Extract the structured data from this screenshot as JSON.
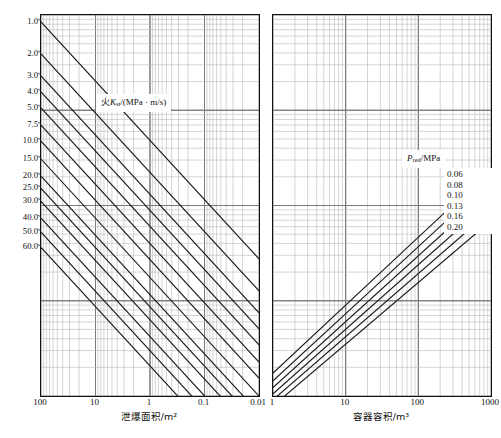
{
  "figure": {
    "title": "",
    "panels": [
      "left",
      "right"
    ]
  },
  "left": {
    "xaxis": {
      "title": "泄爆面积/m²",
      "ticks": [
        "100",
        "10",
        "1",
        "0.1",
        "0.01"
      ],
      "reversed": true
    },
    "legend": {
      "prefix": "火",
      "symbol": "K",
      "subscript": "st",
      "units": "/(MPa · m/s)",
      "full": "火Kst/(MPa · m/s)"
    },
    "series_labels": [
      "1.0",
      "2.0",
      "3.0",
      "4.0",
      "5.0",
      "7.5",
      "10.0",
      "15.0",
      "20.0",
      "25.0",
      "30.0",
      "40.0",
      "50.0",
      "60.0"
    ]
  },
  "right": {
    "xaxis": {
      "title": "容器容积/m³",
      "ticks": [
        "1",
        "10",
        "100",
        "1000"
      ],
      "reversed": false
    },
    "legend": {
      "symbol": "P",
      "subscript": "red",
      "units": "/MPa",
      "full": "Pred /MPa"
    },
    "series_labels": [
      "0.06",
      "0.08",
      "0.10",
      "0.13",
      "0.16",
      "0.20"
    ]
  },
  "colors": {
    "curve": "#1a1a1a",
    "major_grid": "#7a7a7a",
    "minor_grid": "#b8b8b8",
    "frame": "#111111",
    "background": "#ffffff"
  },
  "chart_data": {
    "type": "line",
    "title": "",
    "subtitle": "",
    "panels": [
      {
        "name": "left",
        "title": "",
        "xlabel": "泄爆面积/m²",
        "ylabel": "",
        "xscale": "log",
        "yscale": "log",
        "xlim": [
          100,
          0.01
        ],
        "x_reversed": true,
        "xticks": [
          100,
          10,
          1,
          0.1,
          0.01
        ],
        "grid": true,
        "legend": "火Kst/(MPa · m/s)",
        "legend_position": "center-upper",
        "series": [
          {
            "name": "1.0",
            "label_y_frac": 0.018,
            "x": [
              100,
              0.01
            ],
            "y_frac": [
              0.018,
              0.64
            ]
          },
          {
            "name": "2.0",
            "label_y_frac": 0.102,
            "x": [
              100,
              0.01
            ],
            "y_frac": [
              0.102,
              0.724
            ]
          },
          {
            "name": "3.0",
            "label_y_frac": 0.16,
            "x": [
              100,
              0.01
            ],
            "y_frac": [
              0.16,
              0.782
            ]
          },
          {
            "name": "4.0",
            "label_y_frac": 0.202,
            "x": [
              100,
              0.01
            ],
            "y_frac": [
              0.202,
              0.824
            ]
          },
          {
            "name": "5.0",
            "label_y_frac": 0.244,
            "x": [
              100,
              0.01
            ],
            "y_frac": [
              0.244,
              0.866
            ]
          },
          {
            "name": "7.5",
            "label_y_frac": 0.289,
            "x": [
              100,
              0.01
            ],
            "y_frac": [
              0.289,
              0.911
            ]
          },
          {
            "name": "10.0",
            "label_y_frac": 0.331,
            "x": [
              100,
              0.01
            ],
            "y_frac": [
              0.331,
              0.953
            ]
          },
          {
            "name": "15.0",
            "label_y_frac": 0.378,
            "x": [
              100,
              0.01
            ],
            "y_frac": [
              0.378,
              1.0
            ]
          },
          {
            "name": "20.0",
            "label_y_frac": 0.423,
            "x": [
              100,
              0.01
            ],
            "y_frac": [
              0.423,
              1.045
            ]
          },
          {
            "name": "25.0",
            "label_y_frac": 0.455,
            "x": [
              100,
              0.01
            ],
            "y_frac": [
              0.455,
              1.077
            ]
          },
          {
            "name": "30.0",
            "label_y_frac": 0.489,
            "x": [
              100,
              0.01
            ],
            "y_frac": [
              0.489,
              1.111
            ]
          },
          {
            "name": "40.0",
            "label_y_frac": 0.533,
            "x": [
              100,
              0.01
            ],
            "y_frac": [
              0.533,
              1.155
            ]
          },
          {
            "name": "50.0",
            "label_y_frac": 0.57,
            "x": [
              100,
              0.01
            ],
            "y_frac": [
              0.57,
              1.192
            ]
          },
          {
            "name": "60.0",
            "label_y_frac": 0.61,
            "x": [
              100,
              0.01
            ],
            "y_frac": [
              0.61,
              1.232
            ]
          }
        ]
      },
      {
        "name": "right",
        "title": "",
        "xlabel": "容器容积/m³",
        "ylabel": "",
        "xscale": "log",
        "yscale": "log",
        "xlim": [
          1,
          1000
        ],
        "x_reversed": false,
        "xticks": [
          1,
          10,
          100,
          1000
        ],
        "grid": true,
        "legend": "Pred /MPa",
        "legend_position": "upper-right",
        "series": [
          {
            "name": "0.06",
            "x": [
              1,
              1000
            ],
            "y_frac": [
              0.94,
              0.405
            ]
          },
          {
            "name": "0.08",
            "x": [
              1,
              1000
            ],
            "y_frac": [
              0.96,
              0.432
            ]
          },
          {
            "name": "0.10",
            "x": [
              1,
              1000
            ],
            "y_frac": [
              0.978,
              0.459
            ]
          },
          {
            "name": "0.13",
            "x": [
              1,
              1000
            ],
            "y_frac": [
              0.994,
              0.486
            ]
          },
          {
            "name": "0.16",
            "x": [
              1,
              1000
            ],
            "y_frac": [
              1.01,
              0.513
            ]
          },
          {
            "name": "0.20",
            "x": [
              1,
              1000
            ],
            "y_frac": [
              1.026,
              0.54
            ]
          }
        ]
      }
    ]
  }
}
